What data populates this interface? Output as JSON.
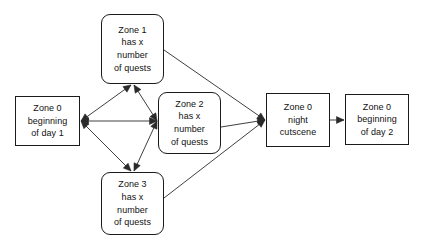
{
  "diagram": {
    "background_color": "#ffffff",
    "line_color": "#2a2a2a",
    "text_color": "#111111",
    "nodes": [
      {
        "id": "zone0_day1",
        "label": "Zone 0\nbeginning\nof day 1",
        "shape": "rectangle",
        "x": 15,
        "y": 96,
        "w": 65,
        "h": 50
      },
      {
        "id": "zone1",
        "label": "Zone 1\nhas x\nnumber\nof quests",
        "shape": "rounded-rectangle",
        "x": 101,
        "y": 14,
        "w": 63,
        "h": 70
      },
      {
        "id": "zone2",
        "label": "Zone 2\nhas x\nnumber\nof quests",
        "shape": "rounded-rectangle",
        "x": 158,
        "y": 92,
        "w": 63,
        "h": 62
      },
      {
        "id": "zone3",
        "label": "Zone 3\nhas x\nnumber\nof quests",
        "shape": "rounded-rectangle",
        "x": 101,
        "y": 172,
        "w": 63,
        "h": 63
      },
      {
        "id": "zone0_night",
        "label": "Zone 0\nnight\ncutscene",
        "shape": "rectangle",
        "x": 266,
        "y": 93,
        "w": 64,
        "h": 54
      },
      {
        "id": "zone0_day2",
        "label": "Zone 0\nbeginning\nof day 2",
        "shape": "rectangle",
        "x": 345,
        "y": 94,
        "w": 64,
        "h": 51
      }
    ],
    "edges": [
      {
        "id": "day1-zone1",
        "from": "zone0_day1",
        "to": "zone1",
        "arrows": "both",
        "x1": 81,
        "y1": 121,
        "x2": 131,
        "y2": 85
      },
      {
        "id": "day1-zone2",
        "from": "zone0_day1",
        "to": "zone2",
        "arrows": "both",
        "x1": 81,
        "y1": 121,
        "x2": 157,
        "y2": 121
      },
      {
        "id": "day1-zone3",
        "from": "zone0_day1",
        "to": "zone3",
        "arrows": "both",
        "x1": 81,
        "y1": 121,
        "x2": 131,
        "y2": 171
      },
      {
        "id": "zone1-zone2",
        "from": "zone1",
        "to": "zone2",
        "arrows": "both",
        "x1": 134,
        "y1": 85,
        "x2": 157,
        "y2": 121
      },
      {
        "id": "zone2-zone3",
        "from": "zone2",
        "to": "zone3",
        "arrows": "both",
        "x1": 157,
        "y1": 121,
        "x2": 134,
        "y2": 171
      },
      {
        "id": "zone1-night",
        "from": "zone1",
        "to": "zone0_night",
        "arrows": "end",
        "x1": 164,
        "y1": 50,
        "x2": 265,
        "y2": 120
      },
      {
        "id": "zone2-night",
        "from": "zone2",
        "to": "zone0_night",
        "arrows": "end",
        "x1": 221,
        "y1": 127,
        "x2": 265,
        "y2": 120
      },
      {
        "id": "zone3-night",
        "from": "zone3",
        "to": "zone0_night",
        "arrows": "end",
        "x1": 164,
        "y1": 198,
        "x2": 265,
        "y2": 120
      },
      {
        "id": "night-day2",
        "from": "zone0_night",
        "to": "zone0_day2",
        "arrows": "end",
        "x1": 330,
        "y1": 120,
        "x2": 344,
        "y2": 120
      }
    ]
  }
}
